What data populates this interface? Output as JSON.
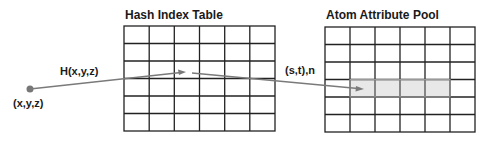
{
  "diagram": {
    "source_point": {
      "label": "(x,y,z)"
    },
    "hash_function_label": "H(x,y,z)",
    "hash_table": {
      "title": "Hash Index Table",
      "rows": 6,
      "cols": 6
    },
    "lookup_label": "(s,t),n",
    "attribute_pool": {
      "title": "Atom Attribute Pool",
      "rows": 6,
      "cols": 6,
      "highlight": {
        "row": 3,
        "col_start": 1,
        "col_end": 4
      }
    },
    "colors": {
      "grid_line": "#222222",
      "arrow": "#7a7a7a",
      "point": "#777777",
      "highlight_fill": "#e8e8e8",
      "highlight_border": "#9a9a9a"
    }
  }
}
